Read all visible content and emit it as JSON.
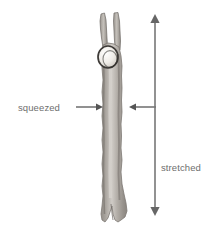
{
  "figure": {
    "width": 220,
    "height": 241,
    "background_color": "#ffffff",
    "type": "labeled-specimen-diagram"
  },
  "labels": {
    "squeezed": "squeezed",
    "stretched": "stretched",
    "text_color": "#6e6e6e"
  },
  "annotations": {
    "squeezed_arrow_left": {
      "name": "arrow-pointing-right",
      "direction": "right",
      "from_x": 76,
      "to_x": 103,
      "y": 107,
      "color": "#555555"
    },
    "squeezed_arrow_right": {
      "name": "arrow-pointing-left",
      "direction": "left",
      "from_x": 156,
      "to_x": 129,
      "y": 107,
      "color": "#555555"
    },
    "stretched_arrow": {
      "name": "double-headed-vertical-arrow",
      "direction": "vertical-both",
      "x": 155,
      "from_y": 14,
      "to_y": 216,
      "color": "#777777"
    }
  },
  "specimen": {
    "name": "muscle-fiber-specimen",
    "description": "elongated forked fiber with constriction bead",
    "fill_color": "#a9a49e",
    "edge_color": "#8b8681",
    "highlight_color": "#c9c5c0",
    "bead": {
      "name": "constriction-bead",
      "fill_color": "#f2f0ec",
      "outline_color": "#3d3a37",
      "cx": 108,
      "cy": 57,
      "rx": 10,
      "ry": 11
    }
  }
}
